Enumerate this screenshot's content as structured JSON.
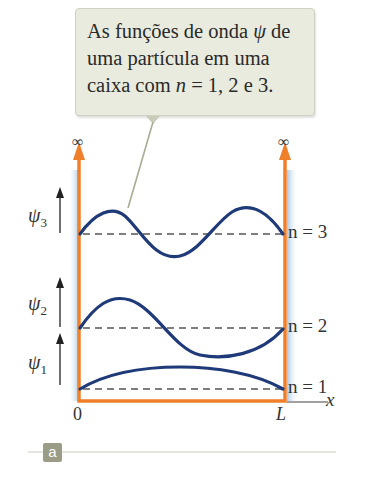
{
  "callout": {
    "line1": "As funções de onda ",
    "psi": "ψ",
    "line1_end": " de",
    "line2": "uma partícula em uma",
    "line3_pre": "caixa com ",
    "n": "n",
    "line3_post": " = 1, 2 e 3."
  },
  "walls": {
    "left_infinity": "∞",
    "right_infinity": "∞"
  },
  "wavefunctions": [
    {
      "label": "ψ",
      "sub": "3",
      "level": "n = 3",
      "n": 3
    },
    {
      "label": "ψ",
      "sub": "2",
      "level": "n = 2",
      "n": 2
    },
    {
      "label": "ψ",
      "sub": "1",
      "level": "n = 1",
      "n": 1
    }
  ],
  "axis": {
    "origin": "0",
    "end": "L",
    "xlabel": "x"
  },
  "panel_tag": "a",
  "colors": {
    "wall": "#f07f2a",
    "wave": "#1f3a78",
    "shade": "#b9d3e6",
    "callout_bg": "#e9ebde",
    "tag_bg": "#9a9c86"
  }
}
